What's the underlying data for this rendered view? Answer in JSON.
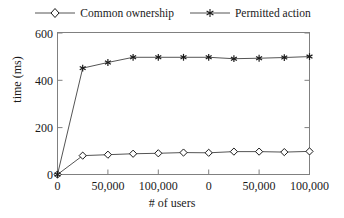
{
  "chart_data": {
    "type": "line",
    "title": "",
    "subtitle": "",
    "xlabel": "# of users",
    "ylabel": "time (ms)",
    "xlim": [
      0,
      11
    ],
    "ylim": [
      0,
      600
    ],
    "grid": false,
    "legend_position": "top-center",
    "x_tick_positions": [
      0,
      2,
      4,
      6,
      8,
      10
    ],
    "x_tick_labels": [
      "0",
      "50,000",
      "100,000",
      "0",
      "50,000",
      "100,000"
    ],
    "y_tick_positions": [
      0,
      200,
      400,
      600
    ],
    "y_tick_labels": [
      "0",
      "200",
      "400",
      "600"
    ],
    "x": [
      0,
      1,
      2,
      3,
      4,
      5,
      6,
      7,
      8,
      9,
      10
    ],
    "series": [
      {
        "name": "Common ownership",
        "marker": "open-diamond",
        "color": "#1a1a1a",
        "values": [
          0,
          80,
          84,
          88,
          90,
          93,
          92,
          97,
          97,
          95,
          98
        ]
      },
      {
        "name": "Permitted action",
        "marker": "filled-star",
        "color": "#1a1a1a",
        "values": [
          0,
          451,
          475,
          497,
          497,
          497,
          497,
          491,
          493,
          496,
          500
        ]
      }
    ]
  },
  "legend": {
    "entries": [
      {
        "label": "Common ownership",
        "marker": "open-diamond-marker"
      },
      {
        "label": "Permitted action",
        "marker": "filled-star-marker"
      }
    ]
  },
  "axes": {
    "x_axis_label": "# of users",
    "y_axis_label": "time (ms)"
  },
  "colors": {
    "line": "#555555",
    "axis": "#808080",
    "text": "#1a1a1a",
    "background": "#ffffff"
  }
}
